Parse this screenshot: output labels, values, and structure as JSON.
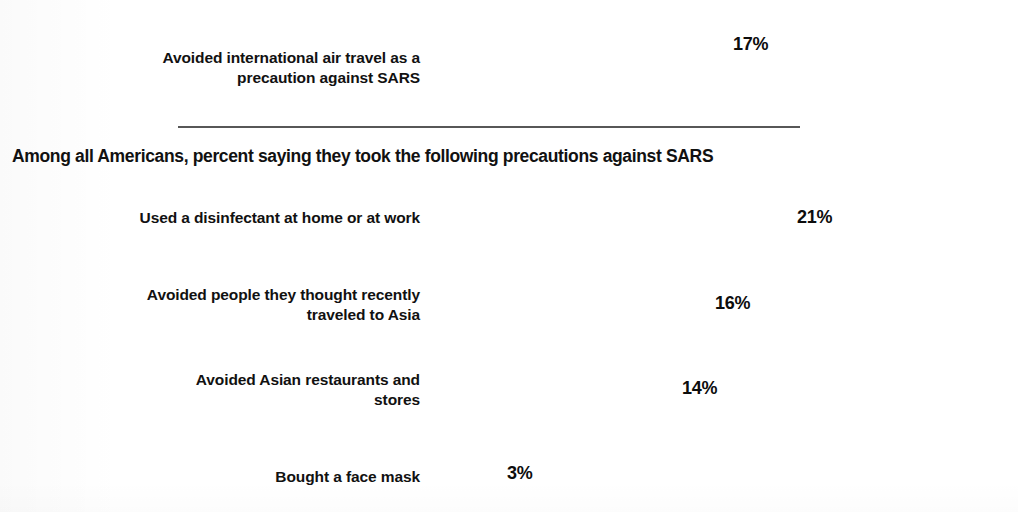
{
  "chart_data": {
    "type": "bar",
    "title": "",
    "subtitle": "",
    "orientation": "horizontal",
    "xlabel": "",
    "ylabel": "",
    "grid": false,
    "legend": null,
    "value_suffix": "%",
    "sections": [
      {
        "id": "top-section",
        "heading": "",
        "categories": [
          "Avoided international air travel as a precaution against SARS"
        ],
        "values": [
          17
        ],
        "value_labels": [
          "17%"
        ]
      },
      {
        "id": "americans-section",
        "heading": "Among all Americans, percent saying they took the following precautions against SARS",
        "categories": [
          "Used a disinfectant at home or at work",
          "Avoided people they thought recently traveled to Asia",
          "Avoided Asian restaurants and stores",
          "Bought a face mask"
        ],
        "values": [
          21,
          16,
          14,
          3
        ],
        "value_labels": [
          "21%",
          "16%",
          "14%",
          "3%"
        ]
      }
    ]
  },
  "rows": [
    {
      "name": "air-travel",
      "label_line1": "Avoided international air travel as a",
      "label_line2": "precaution against SARS",
      "value_label": "17%"
    },
    {
      "name": "disinfectant",
      "label_line1": "Used a disinfectant at home or at work",
      "label_line2": "",
      "value_label": "21%"
    },
    {
      "name": "avoid-people",
      "label_line1": "Avoided people they thought recently",
      "label_line2": "traveled to Asia",
      "value_label": "16%"
    },
    {
      "name": "avoid-restaurants",
      "label_line1": "Avoided Asian restaurants and",
      "label_line2": "stores",
      "value_label": "14%"
    },
    {
      "name": "face-mask",
      "label_line1": "Bought a face mask",
      "label_line2": "",
      "value_label": "3%"
    }
  ],
  "section_heading": "Among all Americans, percent saying they took the following precautions against SARS",
  "colors": {
    "bar_fill": "#2c2c2c",
    "text": "#111111",
    "separator": "#3a3a3a",
    "background": "#ffffff"
  }
}
